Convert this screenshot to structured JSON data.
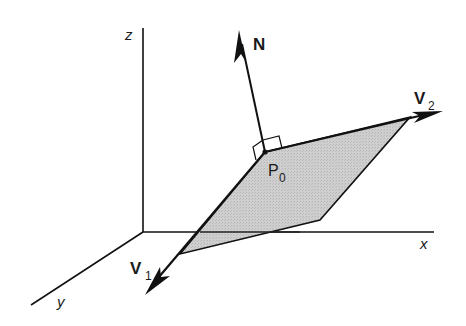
{
  "figure": {
    "type": "3D plane with normal vector",
    "axes": {
      "x_label": "x",
      "y_label": "y",
      "z_label": "z"
    },
    "vectors": {
      "normal": {
        "label": "N"
      },
      "v1": {
        "label": "V",
        "subscript": "1"
      },
      "v2": {
        "label": "V",
        "subscript": "2"
      }
    },
    "point": {
      "label": "P",
      "subscript": "0"
    },
    "colors": {
      "plane_fill": "#c8c8c8",
      "stroke": "#111111",
      "background": "#ffffff"
    }
  }
}
